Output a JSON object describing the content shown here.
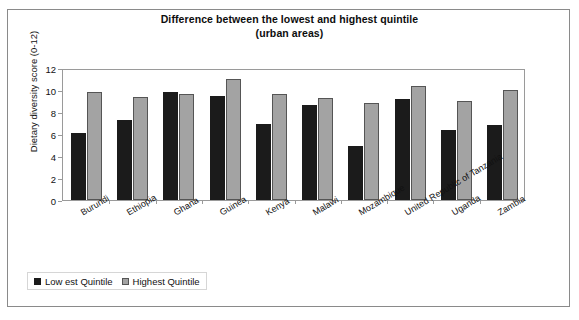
{
  "chart_data": {
    "type": "bar",
    "title": "Difference between the lowest and highest quintile",
    "subtitle": "(urban areas)",
    "xlabel": "",
    "ylabel": "Dietary diversity score (0-12)",
    "ylim": [
      0,
      12
    ],
    "yticks": [
      0,
      2,
      4,
      6,
      8,
      10,
      12
    ],
    "grid": false,
    "legend_position": "bottom-left",
    "categories": [
      "Burundi",
      "Ethiopia",
      "Ghana",
      "Guinea",
      "Kenya",
      "Malawi",
      "Mozambique",
      "United Republic of Tanzania",
      "Uganda",
      "Zambia"
    ],
    "series": [
      {
        "name": "Low est Quintile",
        "color": "#1b1b1b",
        "values": [
          6.1,
          7.3,
          9.85,
          9.5,
          6.9,
          8.6,
          4.9,
          9.2,
          6.4,
          6.8
        ]
      },
      {
        "name": "Highest Quintile",
        "color": "#a3a3a3",
        "values": [
          9.8,
          9.4,
          9.65,
          11.0,
          9.6,
          9.3,
          8.8,
          10.4,
          9.0,
          10.0
        ]
      }
    ]
  },
  "legend": {
    "items": [
      {
        "label": "Low est Quintile",
        "swatch": "low"
      },
      {
        "label": "Highest Quintile",
        "swatch": "high"
      }
    ]
  }
}
